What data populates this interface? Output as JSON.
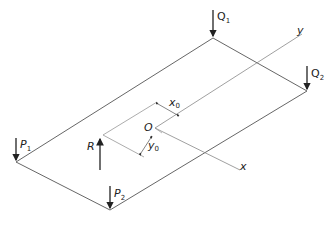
{
  "diagram": {
    "title": "",
    "plate_corners": {
      "top": [
        213,
        13
      ],
      "right": [
        307,
        91
      ],
      "bottom": [
        110,
        210
      ],
      "left": [
        16,
        162
      ]
    },
    "labels": {
      "Q1": {
        "main": "Q",
        "sub": "1"
      },
      "Q2": {
        "main": "Q",
        "sub": "2"
      },
      "P1": {
        "main": "P",
        "sub": "1"
      },
      "P2": {
        "main": "P",
        "sub": "2"
      },
      "R": {
        "main": "R"
      },
      "O": {
        "main": "O"
      },
      "x0": {
        "main": "x",
        "sub": "0"
      },
      "y0": {
        "main": "y",
        "sub": "0"
      },
      "x_axis": {
        "main": "x"
      },
      "y_axis": {
        "main": "y"
      }
    },
    "colors": {
      "line": "#555555",
      "arrow": "#222222",
      "axis": "#888888"
    }
  }
}
